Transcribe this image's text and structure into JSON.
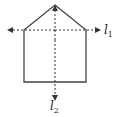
{
  "diagram": {
    "shape": "pentagon",
    "lines": [
      {
        "id": "l1",
        "label": "l",
        "subscript": "1",
        "orientation": "horizontal",
        "style": "dashed"
      },
      {
        "id": "l2",
        "label": "l",
        "subscript": "2",
        "orientation": "vertical",
        "style": "dashed"
      }
    ],
    "colors": {
      "stroke": "#333333",
      "background": "#ffffff"
    }
  }
}
